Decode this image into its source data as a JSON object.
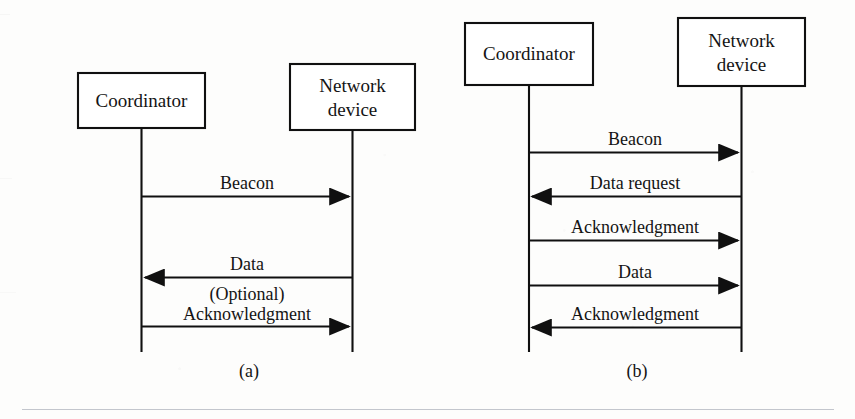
{
  "figure": {
    "background_color": "#fdfdfc",
    "ink_color": "#101010",
    "rule_color": "#b9bcc4",
    "panels": [
      {
        "id": "a",
        "caption": "(a)",
        "nodes": [
          {
            "id": "coordinator",
            "label": "Coordinator",
            "lines": [
              "Coordinator"
            ]
          },
          {
            "id": "network-device",
            "label": "Network device",
            "lines": [
              "Network",
              "device"
            ]
          }
        ],
        "messages": [
          {
            "label": "Beacon",
            "direction": "right",
            "from": "coordinator",
            "to": "network-device"
          },
          {
            "label": "Data",
            "direction": "left",
            "from": "network-device",
            "to": "coordinator"
          },
          {
            "label": "(Optional) Acknowledgment",
            "lines": [
              "(Optional)",
              "Acknowledgment"
            ],
            "direction": "right",
            "from": "coordinator",
            "to": "network-device"
          }
        ]
      },
      {
        "id": "b",
        "caption": "(b)",
        "nodes": [
          {
            "id": "coordinator",
            "label": "Coordinator",
            "lines": [
              "Coordinator"
            ]
          },
          {
            "id": "network-device",
            "label": "Network device",
            "lines": [
              "Network",
              "device"
            ]
          }
        ],
        "messages": [
          {
            "label": "Beacon",
            "direction": "right",
            "from": "coordinator",
            "to": "network-device"
          },
          {
            "label": "Data request",
            "direction": "left",
            "from": "network-device",
            "to": "coordinator"
          },
          {
            "label": "Acknowledgment",
            "direction": "right",
            "from": "coordinator",
            "to": "network-device"
          },
          {
            "label": "Data",
            "direction": "right",
            "from": "coordinator",
            "to": "network-device"
          },
          {
            "label": "Acknowledgment",
            "direction": "left",
            "from": "network-device",
            "to": "coordinator"
          }
        ]
      }
    ]
  },
  "panel_a": {
    "caption": "(a)",
    "node_coordinator": "Coordinator",
    "node_network_line1": "Network",
    "node_network_line2": "device",
    "msg1": "Beacon",
    "msg2": "Data",
    "msg3_line1": "(Optional)",
    "msg3_line2": "Acknowledgment"
  },
  "panel_b": {
    "caption": "(b)",
    "node_coordinator": "Coordinator",
    "node_network_line1": "Network",
    "node_network_line2": "device",
    "msg1": "Beacon",
    "msg2": "Data request",
    "msg3": "Acknowledgment",
    "msg4": "Data",
    "msg5": "Acknowledgment"
  }
}
